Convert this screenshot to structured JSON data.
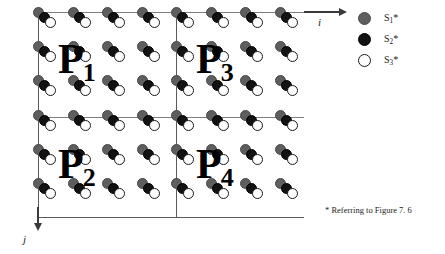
{
  "figure": {
    "quadrants": [
      {
        "id": "P1",
        "base": "P",
        "sub": "1",
        "position": "top-left"
      },
      {
        "id": "P3",
        "base": "P",
        "sub": "3",
        "position": "top-right"
      },
      {
        "id": "P2",
        "base": "P",
        "sub": "2",
        "position": "bottom-left"
      },
      {
        "id": "P4",
        "base": "P",
        "sub": "4",
        "position": "bottom-right"
      }
    ],
    "axes": {
      "horizontal_label": "i",
      "vertical_label": "j",
      "horizontal_direction": "right",
      "vertical_direction": "down"
    },
    "legend": {
      "items": [
        {
          "base": "S",
          "sub": "1",
          "star": "*",
          "color": "#5e5e5e",
          "name": "s1-star"
        },
        {
          "base": "S",
          "sub": "2",
          "star": "*",
          "color": "#121212",
          "name": "s2-star"
        },
        {
          "base": "S",
          "sub": "3",
          "star": "*",
          "color": "#ffffff",
          "name": "s3-star"
        }
      ]
    },
    "footnote": "* Referring to Figure 7. 6",
    "lattice": {
      "columns_per_quadrant": 4,
      "rows_per_quadrant": 3,
      "total_columns": 8,
      "total_rows": 6,
      "cell_width": 34.5,
      "cell_height": 34.2,
      "atoms_per_site": 3,
      "atom_order": [
        "S1*",
        "S2*",
        "S3*"
      ]
    },
    "colors": {
      "s1": "#5e5e5e",
      "s2": "#121212",
      "s3": "#ffffff",
      "grid_line": "#7d7d7d",
      "border": "#5a5a5a",
      "axis": "#3a3a3a",
      "text": "#1a1a1a"
    }
  }
}
